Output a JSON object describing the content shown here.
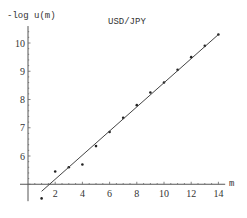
{
  "chart_data": {
    "type": "scatter",
    "title": "USD/JPY",
    "xlabel": "m",
    "ylabel": "-log u(m)",
    "xlim": [
      0,
      14.5
    ],
    "ylim": [
      4.4,
      10.6
    ],
    "x_axis_crosses_y_at": 5,
    "grid": false,
    "legend": null,
    "x_ticks": [
      2,
      4,
      6,
      8,
      10,
      12,
      14
    ],
    "y_ticks": [
      6,
      7,
      8,
      9,
      10
    ],
    "series": [
      {
        "name": "data",
        "kind": "points",
        "x": [
          1,
          2,
          3,
          4,
          5,
          6,
          7,
          8,
          9,
          10,
          11,
          12,
          13,
          14
        ],
        "y": [
          4.5,
          5.45,
          5.6,
          5.7,
          6.35,
          6.85,
          7.35,
          7.8,
          8.25,
          8.6,
          9.05,
          9.5,
          9.9,
          10.3
        ]
      },
      {
        "name": "linear fit",
        "kind": "line",
        "x": [
          1,
          14
        ],
        "y": [
          4.75,
          10.3
        ]
      }
    ]
  },
  "labels": {
    "title": "USD/JPY",
    "ylabel": "-log u(m)",
    "xlabel": "m"
  }
}
